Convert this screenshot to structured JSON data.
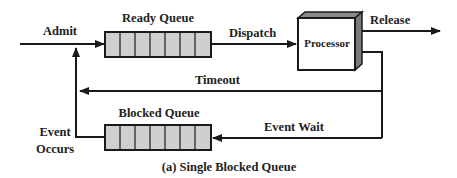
{
  "diagram": {
    "caption": "(a) Single Blocked Queue",
    "colors": {
      "line": "#1a1a1a",
      "queue_fill": "#cfcfcf",
      "processor_front": "#ffffff",
      "processor_top": "#8a8a8a",
      "processor_side": "#7a7a7a",
      "text": "#222222"
    },
    "nodes": {
      "ready_queue": {
        "label": "Ready Queue",
        "cells": 7
      },
      "processor": {
        "label": "Processor"
      },
      "blocked_queue": {
        "label": "Blocked Queue",
        "cells": 7
      }
    },
    "edges": {
      "admit": {
        "label": "Admit"
      },
      "dispatch": {
        "label": "Dispatch"
      },
      "release": {
        "label": "Release"
      },
      "timeout": {
        "label": "Timeout"
      },
      "event_wait": {
        "label": "Event Wait"
      },
      "event_occurs": {
        "label_line1": "Event",
        "label_line2": "Occurs"
      }
    }
  }
}
